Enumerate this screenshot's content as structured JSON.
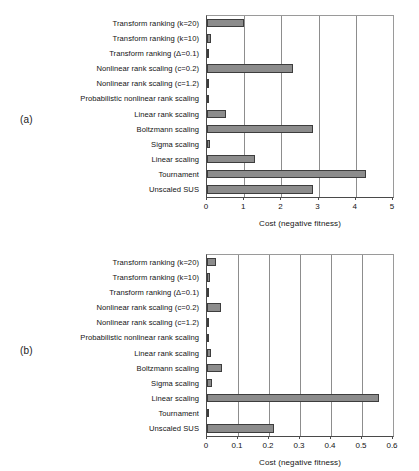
{
  "figure": {
    "panels": [
      {
        "tag": "(a)",
        "chart_data": {
          "type": "bar",
          "orientation": "horizontal",
          "title": "",
          "xlabel": "Cost (negative fitness)",
          "ylabel": "",
          "xlim": [
            0,
            5
          ],
          "xticks": [
            0,
            1,
            2,
            3,
            4,
            5
          ],
          "xticklabels": [
            "0",
            "1",
            "2",
            "3",
            "4",
            "5"
          ],
          "grid": "vertical",
          "legend": "none",
          "categories": [
            "Transform ranking (k=20)",
            "Transform ranking (k=10)",
            "Transform ranking (Δ=0.1)",
            "Nonlinear rank scaling (c=0.2)",
            "Nonlinear rank scaling (c=1.2)",
            "Probabilistic nonlinear rank scaling",
            "Linear rank scaling",
            "Boltzmann scaling",
            "Sigma scaling",
            "Linear scaling",
            "Tournament",
            "Unscaled SUS"
          ],
          "values": [
            1.0,
            0.12,
            0.05,
            2.3,
            0.05,
            0.03,
            0.52,
            2.85,
            0.08,
            1.28,
            4.28,
            2.85
          ]
        }
      },
      {
        "tag": "(b)",
        "chart_data": {
          "type": "bar",
          "orientation": "horizontal",
          "title": "",
          "xlabel": "Cost (negative fitness)",
          "ylabel": "",
          "xlim": [
            0,
            0.6
          ],
          "xticks": [
            0,
            0.1,
            0.2,
            0.3,
            0.4,
            0.5,
            0.6
          ],
          "xticklabels": [
            "0",
            "0.1",
            "0.2",
            "0.3",
            "0.4",
            "0.5",
            "0.6"
          ],
          "grid": "vertical",
          "legend": "none",
          "categories": [
            "Transform ranking (k=20)",
            "Transform ranking (k=10)",
            "Transform ranking (Δ=0.1)",
            "Nonlinear rank scaling (c=0.2)",
            "Nonlinear rank scaling (c=1.2)",
            "Probabilistic nonlinear rank scaling",
            "Linear rank scaling",
            "Boltzmann scaling",
            "Sigma scaling",
            "Linear scaling",
            "Tournament",
            "Unscaled SUS"
          ],
          "values": [
            0.028,
            0.009,
            0.004,
            0.044,
            0.004,
            0.003,
            0.014,
            0.049,
            0.016,
            0.556,
            0.008,
            0.217
          ]
        }
      }
    ],
    "colors": {
      "bar_fill": "#8c8c8c",
      "bar_border": "#3d3d3d",
      "gridline": "#8d8d8d",
      "axis": "#4a4a4a",
      "text": "#141414",
      "background": "#ffffff"
    }
  }
}
